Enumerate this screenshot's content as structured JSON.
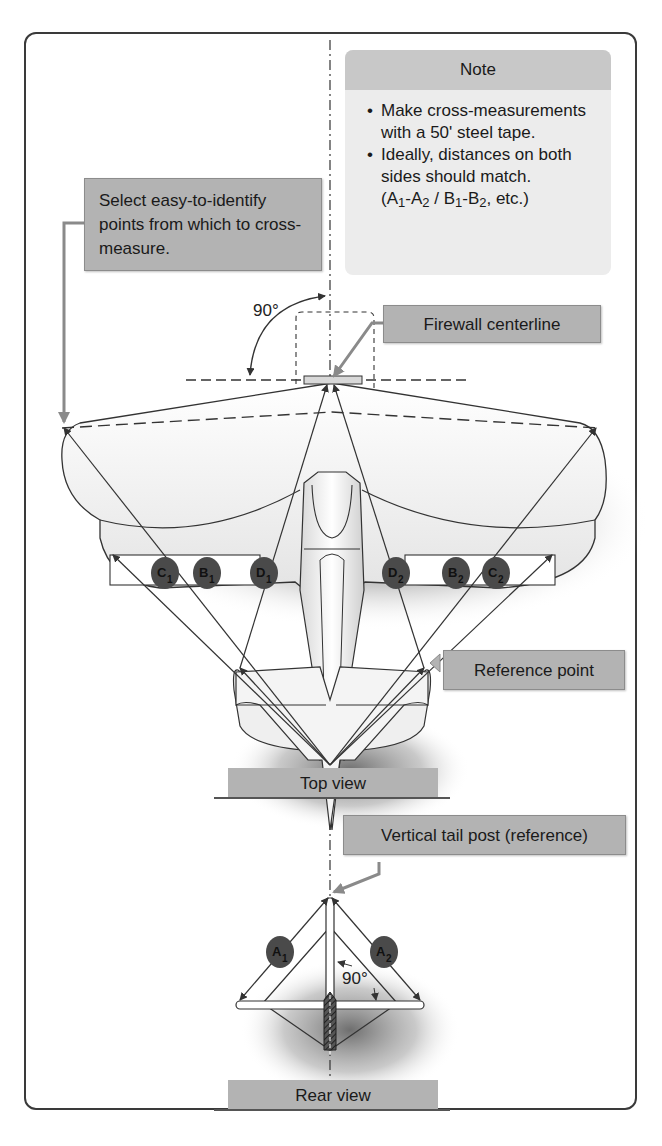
{
  "note": {
    "title": "Note",
    "items": [
      {
        "text": "Make cross-measurements with a 50' steel tape."
      },
      {
        "text": "Ideally, distances on both sides should match.",
        "suffix_parts": [
          "(A",
          "1",
          "-A",
          "2",
          " / B",
          "1",
          "-B",
          "2",
          ", etc.)"
        ]
      }
    ]
  },
  "callouts": {
    "select_points": "Select easy-to-identify points from which to cross-measure.",
    "firewall_centerline": "Firewall centerline",
    "reference_point": "Reference point",
    "vertical_tail_post": "Vertical tail post (reference)"
  },
  "angles": {
    "top_view": "90°",
    "rear_view": "90°"
  },
  "views": {
    "top": "Top view",
    "rear": "Rear view"
  },
  "badges": {
    "C1": {
      "letter": "C",
      "sub": "1"
    },
    "B1": {
      "letter": "B",
      "sub": "1"
    },
    "D1": {
      "letter": "D",
      "sub": "1"
    },
    "D2": {
      "letter": "D",
      "sub": "2"
    },
    "B2": {
      "letter": "B",
      "sub": "2"
    },
    "C2": {
      "letter": "C",
      "sub": "2"
    },
    "A1": {
      "letter": "A",
      "sub": "1"
    },
    "A2": {
      "letter": "A",
      "sub": "2"
    }
  },
  "colors": {
    "callout_fill": "#b3b3b3",
    "note_fill": "#ececec",
    "badge_fill": "#4a4a4a",
    "line": "#3a3a3a",
    "pointer": "#8a8a8a"
  }
}
